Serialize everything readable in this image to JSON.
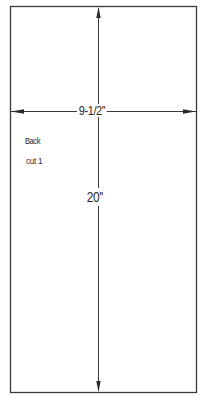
{
  "pattern_piece": {
    "name": "Back",
    "cut_instruction": "cut 1",
    "width_label": "9-1/2''",
    "height_label": "20''",
    "width_value": "9-1/2",
    "height_value": "20",
    "unit": "inches",
    "shape": "rectangle"
  },
  "colors": {
    "line": "#3a3a3a",
    "background": "#ffffff",
    "text": "#2a2a2a"
  }
}
